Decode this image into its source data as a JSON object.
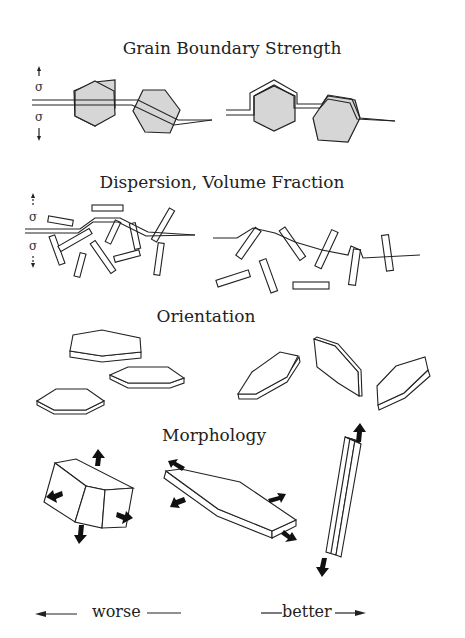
{
  "sections": [
    {
      "id": "grain-boundary",
      "title": "Grain Boundary Strength"
    },
    {
      "id": "dispersion",
      "title": "Dispersion, Volume Fraction"
    },
    {
      "id": "orientation",
      "title": "Orientation"
    },
    {
      "id": "morphology",
      "title": "Morphology"
    }
  ],
  "stress_symbol": "σ",
  "scale": {
    "worse_label": "worse",
    "better_label": "better"
  },
  "colors": {
    "ink": "#222222",
    "grain_fill": "#d6d6d6",
    "background": "#ffffff"
  }
}
